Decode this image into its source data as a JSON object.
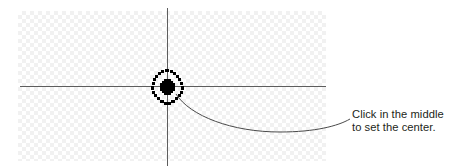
{
  "figure": {
    "background_color": "#ffffff",
    "checker_color": "#f1f1f1",
    "line_color": "#5d5d5d",
    "marker_color": "#000000",
    "text_color": "#231f20"
  },
  "canvas": {
    "name": "transparency-checkerboard",
    "x": 18,
    "y": 11,
    "width": 308,
    "height": 150,
    "tile_size_px": 4
  },
  "guides": {
    "horizontal": {
      "label": "horizontal-guide-line",
      "x1": 20,
      "y1": 86,
      "x2": 326,
      "y2": 86
    },
    "vertical": {
      "label": "vertical-guide-line",
      "x1": 167,
      "y1": 8,
      "x2": 167,
      "y2": 166
    }
  },
  "marker": {
    "label": "center-target-marker",
    "center_x": 168,
    "center_y": 87,
    "outer_radius": 15,
    "style": "dotted-pixelated-circle-with-plus"
  },
  "callout": {
    "leader_label": "callout-leader-curve",
    "start_x": 177,
    "start_y": 95,
    "end_x": 350,
    "end_y": 119,
    "lines": [
      "Click in the middle",
      "to set the center."
    ],
    "line1": "Click in the middle",
    "line2": "to set the center."
  }
}
